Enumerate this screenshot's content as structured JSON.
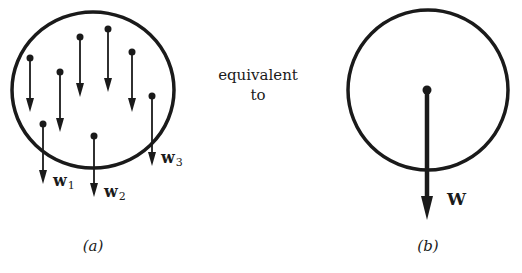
{
  "diagram": {
    "left_panel": {
      "caption": "(a)",
      "circle": {
        "cx": 93,
        "cy": 90,
        "rx": 81,
        "ry": 78
      },
      "arrows": [
        {
          "x": 30,
          "y0": 58,
          "y1": 112,
          "label": ""
        },
        {
          "x": 60,
          "y0": 72,
          "y1": 132,
          "label": ""
        },
        {
          "x": 80,
          "y0": 37,
          "y1": 97,
          "label": ""
        },
        {
          "x": 108,
          "y0": 29,
          "y1": 92,
          "label": ""
        },
        {
          "x": 132,
          "y0": 52,
          "y1": 112,
          "label": ""
        },
        {
          "x": 152,
          "y0": 96,
          "y1": 166,
          "label": "w",
          "sub": "3"
        },
        {
          "x": 43,
          "y0": 124,
          "y1": 184,
          "label": "w",
          "sub": "1"
        },
        {
          "x": 94,
          "y0": 136,
          "y1": 197,
          "label": "w",
          "sub": "2"
        }
      ],
      "labels": {
        "w1": {
          "text": "w",
          "sub": "1"
        },
        "w2": {
          "text": "w",
          "sub": "2"
        },
        "w3": {
          "text": "w",
          "sub": "3"
        }
      }
    },
    "middle_text": {
      "line1": "equivalent",
      "line2": "to"
    },
    "right_panel": {
      "caption": "(b)",
      "circle": {
        "cx": 428,
        "cy": 90,
        "r": 80
      },
      "arrow": {
        "x": 427,
        "y0": 90,
        "y1": 220,
        "label": "W"
      }
    },
    "colors": {
      "stroke": "#1a1a1a",
      "background": "#ffffff"
    }
  }
}
